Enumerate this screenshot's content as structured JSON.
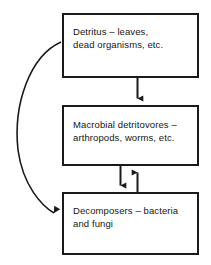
{
  "diagram": {
    "background_color": "#ffffff",
    "line_color": "#1a1a1a",
    "text_color": "#161616",
    "boxes": [
      {
        "id": "detritus",
        "label": "Detritus – leaves,\ndead organisms, etc."
      },
      {
        "id": "macrobial",
        "label": "Macrobial detritovores –\narthropods, worms, etc."
      },
      {
        "id": "decomposers",
        "label": "Decomposers – bacteria\nand fungi"
      }
    ],
    "connectors": [
      {
        "id": "detritus-to-macrobial",
        "from": "detritus",
        "to": "macrobial",
        "style": "straight-vertical",
        "direction": "down"
      },
      {
        "id": "macrobial-to-decomposers",
        "from": "macrobial",
        "to": "decomposers",
        "style": "straight-vertical",
        "direction": "down"
      },
      {
        "id": "decomposers-to-macrobial",
        "from": "decomposers",
        "to": "macrobial",
        "style": "straight-vertical",
        "direction": "up"
      },
      {
        "id": "detritus-to-decomposers",
        "from": "detritus",
        "to": "decomposers",
        "style": "curved-left-bypass",
        "direction": "down"
      }
    ]
  }
}
